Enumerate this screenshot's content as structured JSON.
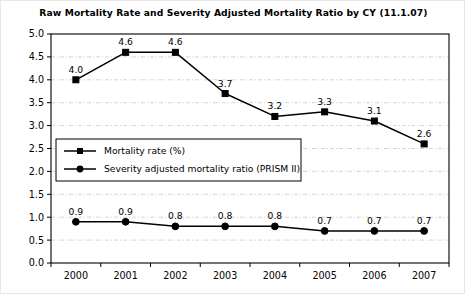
{
  "chart_data": {
    "type": "line",
    "title": "Raw Mortality Rate and Severity Adjusted Mortality Ratio by CY (11.1.07)",
    "xlabel": "",
    "ylabel": "",
    "categories": [
      "2000",
      "2001",
      "2002",
      "2003",
      "2004",
      "2005",
      "2006",
      "2007"
    ],
    "series": [
      {
        "name": "Mortality rate (%)",
        "marker": "square",
        "color": "#000000",
        "values": [
          4.0,
          4.6,
          4.6,
          3.7,
          3.2,
          3.3,
          3.1,
          2.6
        ],
        "labels": [
          "4.0",
          "4.6",
          "4.6",
          "3.7",
          "3.2",
          "3.3",
          "3.1",
          "2.6"
        ]
      },
      {
        "name": "Severity adjusted mortality ratio (PRISM II)",
        "marker": "circle",
        "color": "#000000",
        "values": [
          0.9,
          0.9,
          0.8,
          0.8,
          0.8,
          0.7,
          0.7,
          0.7
        ],
        "labels": [
          "0.9",
          "0.9",
          "0.8",
          "0.8",
          "0.8",
          "0.7",
          "0.7",
          "0.7"
        ]
      }
    ],
    "ylim": [
      0.0,
      5.0
    ],
    "ytick_step": 0.5,
    "yticks": [
      "0.0",
      "0.5",
      "1.0",
      "1.5",
      "2.0",
      "2.5",
      "3.0",
      "3.5",
      "4.0",
      "4.5",
      "5.0"
    ],
    "grid": true,
    "grid_color": "#c9c9c9",
    "grid_style": "dash-dot",
    "legend_position": "inside-left-middle",
    "plot_border_color": "#000000",
    "background": "#ffffff"
  },
  "legend": {
    "entries": [
      "Mortality rate (%)",
      "Severity adjusted mortality ratio (PRISM II)"
    ]
  }
}
